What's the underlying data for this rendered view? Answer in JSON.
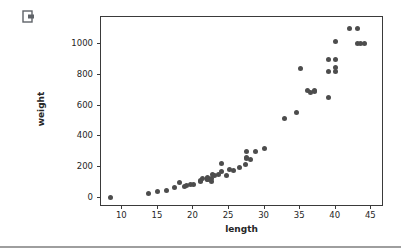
{
  "cell": {
    "action_icon_name": "open-in-new-tab-icon"
  },
  "chart_data": {
    "type": "scatter",
    "title": "",
    "xlabel": "length",
    "ylabel": "weight",
    "xlim": [
      7.0,
      46.5
    ],
    "ylim": [
      -45,
      1175
    ],
    "grid": false,
    "legend": null,
    "marker_color": "#4d4d4d",
    "marker_size_px": 5,
    "xticks": [
      10,
      15,
      20,
      25,
      30,
      35,
      40,
      45
    ],
    "yticks": [
      0,
      200,
      400,
      600,
      800,
      1000
    ],
    "xticklabels": [
      "10",
      "15",
      "20",
      "25",
      "30",
      "35",
      "40",
      "45"
    ],
    "yticklabels": [
      "0",
      "200",
      "400",
      "600",
      "800",
      "1000"
    ],
    "series": [
      {
        "name": "fish",
        "x": [
          8.4,
          13.7,
          15.0,
          16.2,
          17.4,
          18.0,
          18.7,
          19.0,
          19.6,
          20.0,
          21.0,
          21.0,
          21.3,
          22.0,
          22.0,
          22.0,
          22.0,
          22.0,
          22.5,
          22.5,
          22.7,
          23.0,
          23.5,
          24.0,
          24.0,
          24.6,
          25.0,
          25.6,
          26.5,
          27.3,
          27.5,
          27.5,
          27.5,
          28.0,
          28.7,
          30.0,
          32.8,
          34.5,
          35.0,
          36.5,
          36.0,
          37.0,
          37.0,
          39.0,
          39.0,
          39.0,
          40.0,
          40.0,
          40.0,
          40.0,
          42.0,
          43.0,
          43.0,
          43.5,
          44.0
        ],
        "y": [
          5.9,
          32.0,
          40.0,
          51.5,
          70.0,
          100.0,
          78.0,
          80.0,
          85.0,
          85.0,
          110.0,
          115.0,
          125.0,
          130.0,
          120.0,
          120.0,
          130.0,
          135.0,
          110.0,
          130.0,
          150.0,
          145.0,
          150.0,
          170.0,
          225.0,
          145.0,
          188.0,
          180.0,
          197.0,
          218.0,
          300.0,
          260.0,
          265.0,
          250.0,
          300.0,
          320.0,
          514.0,
          556.0,
          840.0,
          685.0,
          700.0,
          700.0,
          690.0,
          900.0,
          650.0,
          820.0,
          850.0,
          900.0,
          1015.0,
          820.0,
          1100.0,
          1100.0,
          1000.0,
          1000.0,
          1000.0
        ]
      }
    ]
  }
}
